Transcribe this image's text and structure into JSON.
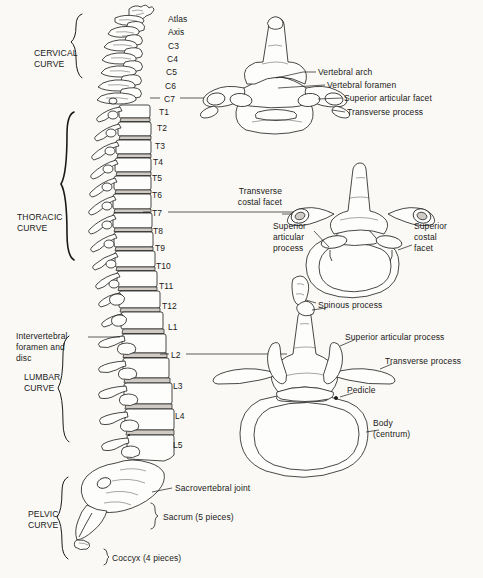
{
  "figure": {
    "background_color": "#faf9f5",
    "ink_color": "#1a1a1a"
  },
  "curves": [
    {
      "id": "cervical",
      "line1": "CERVICAL",
      "line2": "CURVE"
    },
    {
      "id": "thoracic",
      "line1": "THORACIC",
      "line2": "CURVE"
    },
    {
      "id": "lumbar",
      "line1": "LUMBAR",
      "line2": "CURVE"
    },
    {
      "id": "pelvic",
      "line1": "PELVIC",
      "line2": "CURVE"
    }
  ],
  "vertebrae": [
    {
      "label": "Atlas",
      "x": 168,
      "y": 14,
      "leader": false
    },
    {
      "label": "Axis",
      "x": 168,
      "y": 27,
      "leader": false
    },
    {
      "label": "C3",
      "x": 168,
      "y": 41,
      "leader": false
    },
    {
      "label": "C4",
      "x": 167,
      "y": 54,
      "leader": false
    },
    {
      "label": "C5",
      "x": 166,
      "y": 67,
      "leader": false
    },
    {
      "label": "C6",
      "x": 165,
      "y": 81,
      "leader": false
    },
    {
      "label": "C7",
      "x": 164,
      "y": 94,
      "leader": true
    },
    {
      "label": "T1",
      "x": 159,
      "y": 107,
      "leader": false
    },
    {
      "label": "T2",
      "x": 157,
      "y": 123,
      "leader": false
    },
    {
      "label": "T3",
      "x": 155,
      "y": 141,
      "leader": false
    },
    {
      "label": "T4",
      "x": 153,
      "y": 157,
      "leader": false
    },
    {
      "label": "T5",
      "x": 152,
      "y": 173,
      "leader": false
    },
    {
      "label": "T6",
      "x": 152,
      "y": 190,
      "leader": false
    },
    {
      "label": "T7",
      "x": 152,
      "y": 208,
      "leader": true
    },
    {
      "label": "T8",
      "x": 153,
      "y": 226,
      "leader": false
    },
    {
      "label": "T9",
      "x": 155,
      "y": 243,
      "leader": false
    },
    {
      "label": "T10",
      "x": 156,
      "y": 261,
      "leader": false
    },
    {
      "label": "T11",
      "x": 159,
      "y": 281,
      "leader": false
    },
    {
      "label": "T12",
      "x": 162,
      "y": 301,
      "leader": false
    },
    {
      "label": "L1",
      "x": 168,
      "y": 322,
      "leader": false
    },
    {
      "label": "L2",
      "x": 171,
      "y": 350,
      "leader": true
    },
    {
      "label": "L3",
      "x": 173,
      "y": 381,
      "leader": false
    },
    {
      "label": "L4",
      "x": 175,
      "y": 411,
      "leader": false
    },
    {
      "label": "L5",
      "x": 173,
      "y": 440,
      "leader": false
    }
  ],
  "spine_labels": {
    "intervertebral": "Intervertebral\nforamen and\ndisc",
    "sacrovertebral_joint": "Sacrovertebral joint",
    "sacrum": "Sacrum (5 pieces)",
    "coccyx": "Coccyx (4 pieces)"
  },
  "cervical_vertebra": {
    "name": "cervical-vertebra-superior-view",
    "callouts": [
      {
        "id": "vertebral-arch",
        "text": "Vertebral arch"
      },
      {
        "id": "vertebral-foramen",
        "text": "Vertebral foramen"
      },
      {
        "id": "superior-articular-facet",
        "text": "Superior articular facet"
      },
      {
        "id": "transverse-process",
        "text": "Transverse process"
      }
    ]
  },
  "thoracic_vertebra": {
    "name": "thoracic-vertebra-superior-view",
    "callouts": [
      {
        "id": "transverse-costal-facet",
        "text": "Transverse\ncostal facet"
      },
      {
        "id": "superior-articular-process",
        "text": "Superior\narticular\nprocess"
      },
      {
        "id": "superior-costal-facet",
        "text": "Superior\ncostal\nfacet"
      }
    ]
  },
  "lumbar_vertebra": {
    "name": "lumbar-vertebra-superior-view",
    "callouts": [
      {
        "id": "spinous-process",
        "text": "Spinous process"
      },
      {
        "id": "superior-articular-process",
        "text": "Superior articular process"
      },
      {
        "id": "transverse-process",
        "text": "Transverse process"
      },
      {
        "id": "pedicle",
        "text": "Pedicle"
      },
      {
        "id": "body-centrum",
        "text": "Body\n(centrum)"
      }
    ]
  }
}
